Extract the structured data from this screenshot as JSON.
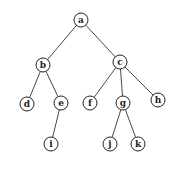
{
  "diagram": {
    "type": "tree",
    "node_radius": 7,
    "colors": {
      "stroke": "#222222",
      "fill": "#ffffff",
      "text": "#222222"
    },
    "nodes": [
      {
        "id": "a",
        "label": "a",
        "x": 81,
        "y": 20
      },
      {
        "id": "b",
        "label": "b",
        "x": 43,
        "y": 65
      },
      {
        "id": "c",
        "label": "c",
        "x": 120,
        "y": 62
      },
      {
        "id": "d",
        "label": "d",
        "x": 27,
        "y": 104
      },
      {
        "id": "e",
        "label": "e",
        "x": 61,
        "y": 103
      },
      {
        "id": "f",
        "label": "f",
        "x": 90,
        "y": 103
      },
      {
        "id": "g",
        "label": "g",
        "x": 123,
        "y": 103
      },
      {
        "id": "h",
        "label": "h",
        "x": 158,
        "y": 100
      },
      {
        "id": "i",
        "label": "i",
        "x": 51,
        "y": 144
      },
      {
        "id": "j",
        "label": "j",
        "x": 110,
        "y": 144
      },
      {
        "id": "k",
        "label": "k",
        "x": 138,
        "y": 144
      }
    ],
    "edges": [
      [
        "a",
        "b"
      ],
      [
        "a",
        "c"
      ],
      [
        "b",
        "d"
      ],
      [
        "b",
        "e"
      ],
      [
        "c",
        "f"
      ],
      [
        "c",
        "g"
      ],
      [
        "c",
        "h"
      ],
      [
        "e",
        "i"
      ],
      [
        "g",
        "j"
      ],
      [
        "g",
        "k"
      ]
    ]
  }
}
